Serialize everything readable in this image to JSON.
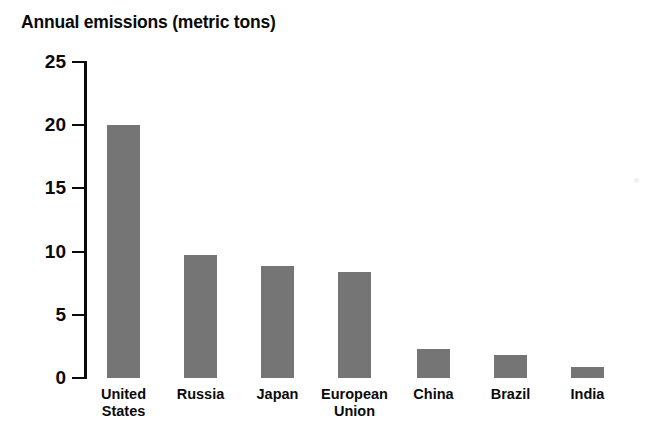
{
  "chart_data": {
    "type": "bar",
    "title": "Annual emissions (metric tons)",
    "xlabel": "",
    "ylabel": "",
    "ylim": [
      0,
      25
    ],
    "yticks": [
      0,
      5,
      10,
      15,
      20,
      25
    ],
    "ytick_labels": [
      "0",
      "5",
      "10",
      "15",
      "20",
      "25"
    ],
    "grid": false,
    "legend": false,
    "bar_color": "#757575",
    "axis_color": "#0a0a0a",
    "background": "#ffffff",
    "categories": [
      "United\nStates",
      "Russia",
      "Japan",
      "European\nUnion",
      "China",
      "Brazil",
      "India"
    ],
    "category_labels_flat": [
      "United States",
      "Russia",
      "Japan",
      "European Union",
      "China",
      "Brazil",
      "India"
    ],
    "values": [
      20.0,
      9.7,
      8.9,
      8.4,
      2.3,
      1.8,
      0.9
    ],
    "series": [
      {
        "name": "Annual emissions (metric tons)",
        "values": [
          20.0,
          9.7,
          8.9,
          8.4,
          2.3,
          1.8,
          0.9
        ]
      }
    ]
  },
  "geometry": {
    "bar_lefts_px": [
      107,
      184,
      261,
      338,
      417,
      494,
      571
    ],
    "bar_width_px": 33,
    "baseline_y_px": 378,
    "top_y_px": 62,
    "px_per_unit": 12.64,
    "cat_centers_px": [
      123.5,
      200.5,
      277.5,
      354.5,
      433.5,
      510.5,
      587.5
    ]
  }
}
